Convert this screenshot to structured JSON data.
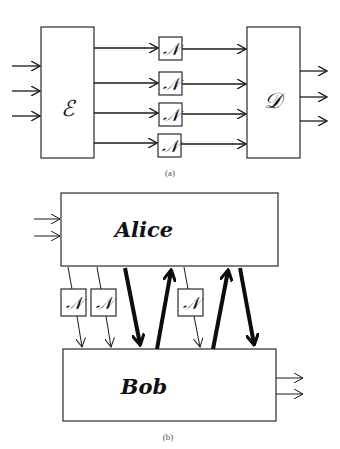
{
  "diagram_a": {
    "caption": "(a)",
    "encoder_label": "ℰ",
    "decoder_label": "𝒟",
    "noise_label": "𝒩",
    "input_count": 3,
    "channel_count": 4,
    "output_count": 3
  },
  "diagram_b": {
    "caption": "(b)",
    "sender_label": "Alice",
    "receiver_label": "Bob",
    "noise_label": "𝒩",
    "input_count": 2,
    "noisy_channel_count": 3,
    "thick_down_count": 2,
    "thick_up_count": 2,
    "output_count": 2
  }
}
